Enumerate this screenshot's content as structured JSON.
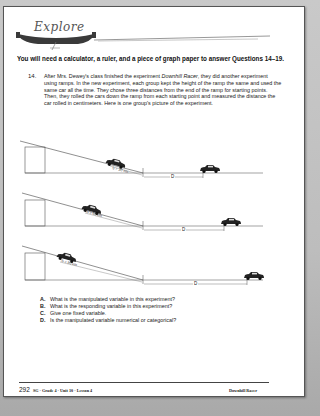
{
  "banner": {
    "title": "Explore"
  },
  "intro": "You will need a calculator, a ruler, and a piece of graph paper to answer Questions 14–19.",
  "question": {
    "number": "14.",
    "text_before": "After Mrs. Dewey's class finished the experiment ",
    "experiment_name": "Downhill Racer",
    "text_after": ", they did another experiment using ramps. In the new experiment, each group kept the height of the ramp the same and used the same car all the time. They chose three distances from the end of the ramp for starting points. Then, they rolled the cars down the ramp from each starting point and measured the distance the car rolled in centimeters. Here is one group's picture of the experiment."
  },
  "diagram": {
    "ramps": [
      {
        "s_label": "S = 30 cm",
        "d_label": "D"
      },
      {
        "s_label": "S = 60 cm",
        "d_label": "D"
      },
      {
        "s_label": "S = 90 cm",
        "d_label": "D"
      }
    ]
  },
  "sub_questions": [
    {
      "letter": "A.",
      "text": "What is the manipulated variable in this experiment?"
    },
    {
      "letter": "B.",
      "text": "What is the responding variable in this experiment?"
    },
    {
      "letter": "C.",
      "text": "Give one fixed variable."
    },
    {
      "letter": "D.",
      "text": "Is the manipulated variable numerical or categorical?"
    }
  ],
  "footer": {
    "page_number": "292",
    "left": "SG · Grade 4 · Unit 10 · Lesson 4",
    "right": "Downhill Racer"
  }
}
